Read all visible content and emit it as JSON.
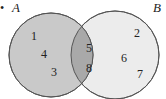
{
  "diagram": {
    "type": "venn",
    "sets": [
      {
        "name": "A",
        "color": "#c9c9c9",
        "only": [
          "1",
          "4",
          "3"
        ]
      },
      {
        "name": "B",
        "color": "#ececec",
        "only": [
          "2",
          "6",
          "7"
        ]
      }
    ],
    "intersection": {
      "color": "#a9a9a9",
      "elements": [
        "5",
        "8"
      ]
    },
    "labels": {
      "A": "A",
      "B": "B"
    },
    "elements": {
      "a1": "1",
      "a2": "4",
      "a3": "3",
      "ab1": "5",
      "ab2": "8",
      "b1": "2",
      "b2": "6",
      "b3": "7"
    },
    "marker": "•"
  }
}
